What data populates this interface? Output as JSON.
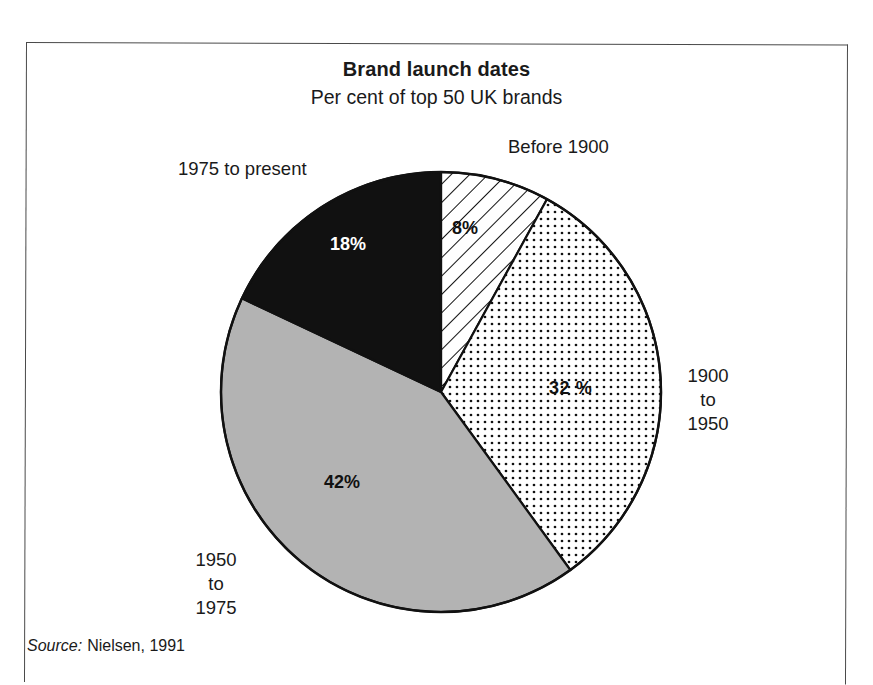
{
  "chart_data": {
    "type": "pie",
    "title": "Brand launch dates",
    "subtitle": "Per cent of top 50 UK brands",
    "xlabel": "",
    "ylabel": "",
    "units": "per cent",
    "legend_position": "around-slices",
    "grid": false,
    "start_angle_deg": 0,
    "direction": "clockwise",
    "categories": [
      "Before 1900",
      "1900 to 1950",
      "1950 to 1975",
      "1975 to present"
    ],
    "values": [
      8,
      32,
      42,
      18
    ],
    "value_labels": [
      "8%",
      "32%",
      "42%",
      "18%"
    ],
    "slices": [
      {
        "name": "before-1900",
        "label": "Before 1900",
        "value": 8,
        "value_label": "8%",
        "fill": "diagonal-hatch",
        "fill_color": "#ffffff",
        "label_color": "#111111"
      },
      {
        "name": "1900-1950",
        "label": "1900\nto\n1950",
        "value": 32,
        "value_label": "32 %",
        "fill": "dotted",
        "fill_color": "#ffffff",
        "label_color": "#111111"
      },
      {
        "name": "1950-1975",
        "label": "1950\nto\n1975",
        "value": 42,
        "value_label": "42%",
        "fill": "solid-gray",
        "fill_color": "#b3b3b3",
        "label_color": "#111111"
      },
      {
        "name": "1975-present",
        "label": "1975 to present",
        "value": 18,
        "value_label": "18%",
        "fill": "solid-black",
        "fill_color": "#111111",
        "label_color": "#ffffff"
      }
    ]
  },
  "source": {
    "key": "Source:",
    "text": "Nielsen, 1991"
  },
  "colors": {
    "stroke": "#111111",
    "gray_slice": "#b3b3b3",
    "black_slice": "#111111",
    "background": "#ffffff",
    "frame": "#4a4a4a"
  }
}
